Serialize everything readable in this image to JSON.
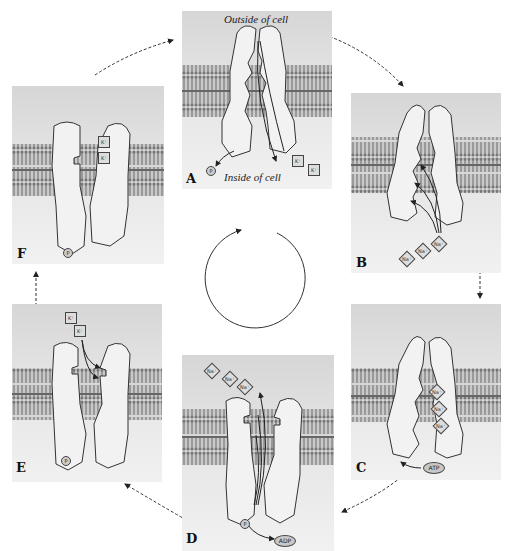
{
  "diagram": {
    "captions": {
      "outside": "Outside of cell",
      "inside": "Inside of cell"
    },
    "panels": [
      {
        "id": "A",
        "label": "A",
        "state": "open to inside, K+ released, P released",
        "ions": [
          {
            "type": "K+",
            "text": "K⁺"
          },
          {
            "type": "K+",
            "text": "K⁺"
          }
        ],
        "extras": [
          {
            "type": "phosphate",
            "text": "P"
          }
        ]
      },
      {
        "id": "B",
        "label": "B",
        "state": "Na+ binds from inside",
        "ions": [
          {
            "type": "Na+",
            "text": "Na⁺"
          },
          {
            "type": "Na+",
            "text": "Na⁺"
          },
          {
            "type": "Na+",
            "text": "Na⁺"
          }
        ]
      },
      {
        "id": "C",
        "label": "C",
        "state": "3 Na+ bound, ATP binds",
        "ions": [
          {
            "type": "Na+",
            "text": "Na⁺"
          },
          {
            "type": "Na+",
            "text": "Na⁺"
          },
          {
            "type": "Na+",
            "text": "Na⁺"
          }
        ],
        "extras": [
          {
            "type": "ATP",
            "text": "ATP"
          }
        ]
      },
      {
        "id": "D",
        "label": "D",
        "state": "phosphorylated, opens outward, Na+ released, ADP released",
        "ions": [
          {
            "type": "Na+",
            "text": "Na⁺"
          },
          {
            "type": "Na+",
            "text": "Na⁺"
          },
          {
            "type": "Na+",
            "text": "Na⁺"
          }
        ],
        "extras": [
          {
            "type": "phosphate",
            "text": "P"
          },
          {
            "type": "ADP",
            "text": "ADP"
          }
        ]
      },
      {
        "id": "E",
        "label": "E",
        "state": "K+ binds from outside",
        "ions": [
          {
            "type": "K+",
            "text": "K⁺"
          },
          {
            "type": "K+",
            "text": "K⁺"
          }
        ],
        "extras": [
          {
            "type": "phosphate",
            "text": "P"
          }
        ]
      },
      {
        "id": "F",
        "label": "F",
        "state": "2 K+ bound",
        "ions": [
          {
            "type": "K+",
            "text": "K⁺"
          },
          {
            "type": "K+",
            "text": "K⁺"
          }
        ],
        "extras": [
          {
            "type": "phosphate",
            "text": "P"
          }
        ]
      }
    ],
    "cycle_order": [
      "A",
      "B",
      "C",
      "D",
      "E",
      "F"
    ],
    "center_symbol": "clockwise-cycle-arrow",
    "colors": {
      "background": "#ffffff",
      "panel_top": "#d6d6d6",
      "panel_bottom": "#f1f1f1",
      "membrane": "#8a8a8a",
      "protein": "#f4f4f4",
      "outline": "#333333",
      "arrow": "#222222"
    }
  }
}
